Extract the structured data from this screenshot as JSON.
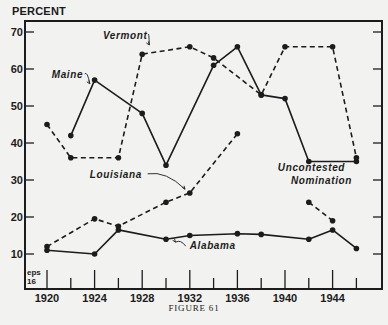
{
  "figure": {
    "caption": "FIGURE 61",
    "y_axis_title": "PERCENT",
    "corner_note": [
      "eps",
      "16"
    ]
  },
  "chart_data": {
    "type": "line",
    "title": "",
    "xlabel": "",
    "ylabel": "PERCENT",
    "xlim": [
      1920,
      1948
    ],
    "ylim": [
      0,
      70
    ],
    "x_ticks_major": [
      1920,
      1924,
      1928,
      1932,
      1936,
      1940,
      1944
    ],
    "x_ticks_minor": [
      1922,
      1926,
      1930,
      1934,
      1938,
      1942,
      1946
    ],
    "y_ticks": [
      10,
      20,
      30,
      40,
      50,
      60,
      70
    ],
    "grid": false,
    "legend": "inline labels",
    "series": [
      {
        "name": "Maine",
        "style": "solid",
        "segments": [
          [
            [
              1922,
              42
            ],
            [
              1924,
              57
            ],
            [
              1928,
              48
            ],
            [
              1930,
              34
            ],
            [
              1934,
              61
            ],
            [
              1936,
              66
            ],
            [
              1938,
              53
            ],
            [
              1940,
              52
            ],
            [
              1942,
              35
            ],
            [
              1946,
              35
            ]
          ]
        ]
      },
      {
        "name": "Vermont",
        "style": "dashed",
        "segments": [
          [
            [
              1920,
              45
            ],
            [
              1922,
              36
            ],
            [
              1926,
              36
            ],
            [
              1928,
              64
            ],
            [
              1932,
              66
            ],
            [
              1934,
              63
            ],
            [
              1938,
              53
            ],
            [
              1940,
              66
            ],
            [
              1944,
              66
            ],
            [
              1946,
              36
            ]
          ]
        ]
      },
      {
        "name": "Louisiana",
        "style": "dashed",
        "segments": [
          [
            [
              1920,
              12
            ],
            [
              1924,
              19.5
            ],
            [
              1926,
              17.5
            ],
            [
              1930,
              24
            ],
            [
              1932,
              26.5
            ],
            [
              1936,
              42.5
            ]
          ],
          [
            [
              1942,
              24
            ],
            [
              1944,
              19
            ]
          ]
        ]
      },
      {
        "name": "Alabama",
        "style": "solid",
        "segments": [
          [
            [
              1920,
              11
            ],
            [
              1924,
              10
            ],
            [
              1926,
              16.5
            ],
            [
              1930,
              14
            ],
            [
              1932,
              15
            ],
            [
              1936,
              15.5
            ],
            [
              1938,
              15.3
            ],
            [
              1942,
              14
            ],
            [
              1944,
              16.5
            ],
            [
              1946,
              11.5
            ]
          ]
        ]
      }
    ],
    "annotations": [
      {
        "text": "Maine",
        "x": 1920.4,
        "y": 57.6,
        "arrow_to": [
          1923.6,
          56
        ]
      },
      {
        "text": "Vermont",
        "x": 1924.7,
        "y": 68.2,
        "arrow_to": [
          1928.6,
          66.5
        ]
      },
      {
        "text": "Louisiana",
        "x": 1923.6,
        "y": 30.6,
        "arrow_to": [
          1931.6,
          27.5
        ]
      },
      {
        "text": "Alabama",
        "x": 1932,
        "y": 11.3,
        "arrow_to": [
          1930.8,
          13.2
        ]
      },
      {
        "text": "Uncontested",
        "x": 1939.4,
        "y": 32.4
      },
      {
        "text": "Nomination",
        "x": 1940.5,
        "y": 29
      }
    ]
  }
}
